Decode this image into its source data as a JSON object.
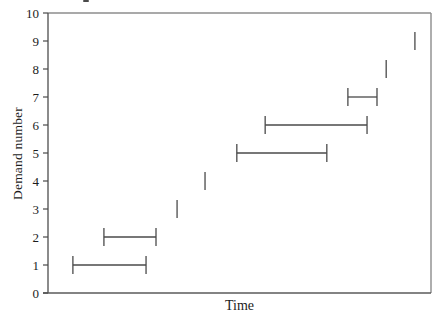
{
  "figure": {
    "background": "#ffffff"
  },
  "chart_data": {
    "type": "interval",
    "title": "",
    "xlabel": "Time",
    "ylabel": "Demand number",
    "ylim": [
      0,
      10
    ],
    "yticks": [
      0,
      1,
      2,
      3,
      4,
      5,
      6,
      7,
      8,
      9,
      10
    ],
    "x_axis": {
      "tick_labels_visible": false,
      "range_fraction": [
        0,
        1
      ]
    },
    "legend": "none",
    "grid": "off",
    "intervals": [
      {
        "demand": 1,
        "start": 0.065,
        "end": 0.256
      },
      {
        "demand": 2,
        "start": 0.146,
        "end": 0.282
      },
      {
        "demand": 3,
        "start": 0.337,
        "end": 0.337
      },
      {
        "demand": 4,
        "start": 0.41,
        "end": 0.41
      },
      {
        "demand": 5,
        "start": 0.493,
        "end": 0.728
      },
      {
        "demand": 6,
        "start": 0.567,
        "end": 0.833
      },
      {
        "demand": 7,
        "start": 0.783,
        "end": 0.859
      },
      {
        "demand": 8,
        "start": 0.883,
        "end": 0.883
      },
      {
        "demand": 9,
        "start": 0.958,
        "end": 0.958
      }
    ],
    "colors": {
      "segment": "#4a4a4a",
      "axis": "#5a5a5a",
      "frame": "#8c8c8c",
      "tick": "#4a4a4a",
      "text": "#1c1c1c"
    }
  }
}
